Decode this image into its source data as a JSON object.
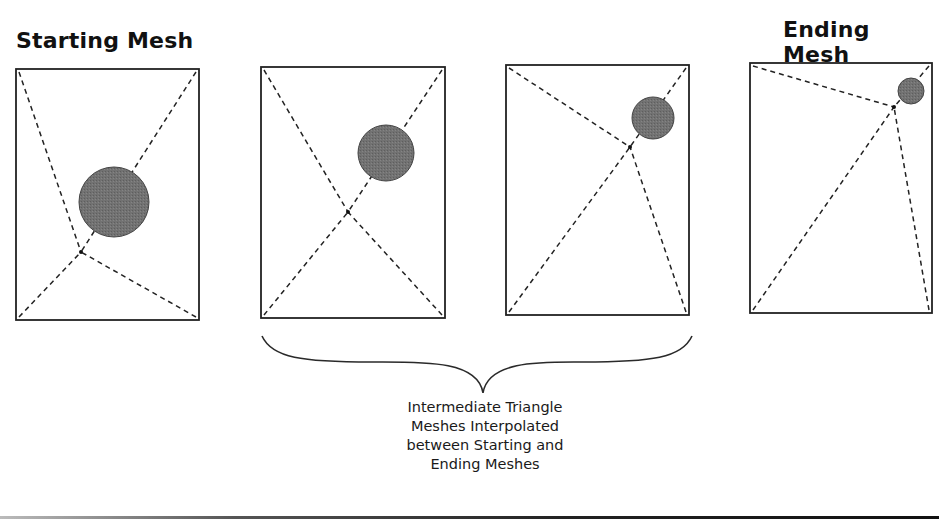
{
  "titles": {
    "start": "Starting Mesh",
    "end": "Ending Mesh"
  },
  "caption": {
    "lines": [
      "Intermediate Triangle",
      "Meshes Interpolated",
      "between Starting and",
      "Ending Meshes"
    ]
  },
  "colors": {
    "frame": "#222222",
    "dash": "#222222",
    "circle_fill": "#6f6f6f",
    "circle_stroke": "#444444"
  },
  "meshes": [
    {
      "name": "starting-mesh",
      "frame": {
        "x": 16,
        "y": 69,
        "w": 183,
        "h": 251
      },
      "vertex": {
        "x": 81,
        "y": 252
      },
      "circle": {
        "cx": 114,
        "cy": 202,
        "r": 35
      }
    },
    {
      "name": "intermediate-mesh-1",
      "frame": {
        "x": 261,
        "y": 67,
        "w": 184,
        "h": 251
      },
      "vertex": {
        "x": 348,
        "y": 212
      },
      "circle": {
        "cx": 386,
        "cy": 153,
        "r": 28
      }
    },
    {
      "name": "intermediate-mesh-2",
      "frame": {
        "x": 506,
        "y": 65,
        "w": 183,
        "h": 250
      },
      "vertex": {
        "x": 630,
        "y": 147
      },
      "circle": {
        "cx": 653,
        "cy": 118,
        "r": 21
      }
    },
    {
      "name": "ending-mesh",
      "frame": {
        "x": 750,
        "y": 63,
        "w": 182,
        "h": 250
      },
      "vertex": {
        "x": 894,
        "y": 107
      },
      "circle": {
        "cx": 911,
        "cy": 91,
        "r": 13
      }
    }
  ],
  "brace": {
    "left_x": 262,
    "right_x": 692,
    "top_y": 336,
    "mid_x": 483,
    "tip_y": 393
  }
}
